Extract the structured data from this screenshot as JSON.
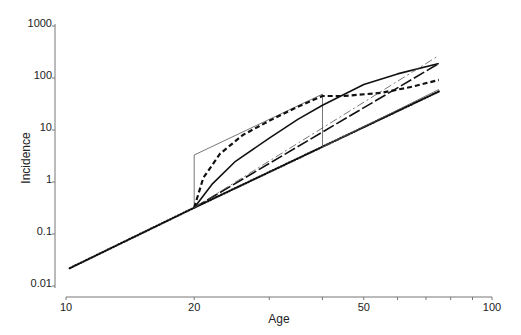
{
  "chart_data": {
    "type": "line",
    "title": "",
    "xlabel": "Age",
    "ylabel": "Incidence",
    "xscale": "log",
    "yscale": "log",
    "xlim": [
      10,
      100
    ],
    "ylim": [
      0.01,
      1000
    ],
    "x_ticks": [
      10,
      20,
      30,
      40,
      50,
      60,
      70,
      80,
      90,
      100
    ],
    "x_tick_labels": [
      {
        "value": 10,
        "label": "10"
      },
      {
        "value": 20,
        "label": "20"
      },
      {
        "value": 50,
        "label": "50"
      },
      {
        "value": 100,
        "label": "100"
      }
    ],
    "y_tick_labels": [
      {
        "value": 0.01,
        "label": "0.01"
      },
      {
        "value": 0.1,
        "label": "0.1"
      },
      {
        "value": 1,
        "label": "1"
      },
      {
        "value": 10,
        "label": "10"
      },
      {
        "value": 100,
        "label": "100"
      },
      {
        "value": 1000,
        "label": "1000"
      }
    ],
    "grid": false,
    "legend": null,
    "series": [
      {
        "name": "dotted baseline",
        "style": "dotted",
        "width": 2.2,
        "color": "#111111",
        "points": [
          [
            10.2,
            0.022
          ],
          [
            20,
            0.32
          ],
          [
            75,
            55
          ]
        ]
      },
      {
        "name": "thin solid step",
        "style": "solid",
        "width": 0.8,
        "color": "#555555",
        "points": [
          [
            20,
            0.32
          ],
          [
            20,
            3.3
          ],
          [
            40,
            49
          ],
          [
            40,
            4.7
          ],
          [
            75,
            60
          ]
        ]
      },
      {
        "name": "heavy dashed",
        "style": "dashed",
        "width": 2.2,
        "color": "#111111",
        "points": [
          [
            20,
            0.32
          ],
          [
            21,
            1.2
          ],
          [
            23,
            3.5
          ],
          [
            26,
            8
          ],
          [
            30,
            15
          ],
          [
            35,
            28
          ],
          [
            40,
            45
          ],
          [
            45,
            45
          ],
          [
            55,
            52
          ],
          [
            65,
            68
          ],
          [
            75,
            92
          ]
        ]
      },
      {
        "name": "heavy solid curve",
        "style": "solid",
        "width": 1.6,
        "color": "#111111",
        "points": [
          [
            20,
            0.32
          ],
          [
            22,
            0.9
          ],
          [
            25,
            2.5
          ],
          [
            30,
            7
          ],
          [
            35,
            16
          ],
          [
            40,
            30
          ],
          [
            50,
            75
          ],
          [
            60,
            120
          ],
          [
            75,
            190
          ]
        ]
      },
      {
        "name": "long dash-dot",
        "style": "longdash",
        "width": 1.6,
        "color": "#111111",
        "points": [
          [
            20,
            0.32
          ],
          [
            75,
            190
          ]
        ]
      },
      {
        "name": "thin dash-dot",
        "style": "dashdot",
        "width": 0.8,
        "color": "#555555",
        "points": [
          [
            20,
            0.32
          ],
          [
            75,
            270
          ]
        ]
      }
    ]
  }
}
